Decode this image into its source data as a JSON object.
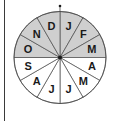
{
  "diagram": {
    "type": "month-wheel",
    "start_at_top": true,
    "direction": "clockwise",
    "months": [
      {
        "label": "J",
        "shaded": true
      },
      {
        "label": "F",
        "shaded": true
      },
      {
        "label": "M",
        "shaded": true
      },
      {
        "label": "A",
        "shaded": false
      },
      {
        "label": "M",
        "shaded": false
      },
      {
        "label": "J",
        "shaded": false
      },
      {
        "label": "J",
        "shaded": false
      },
      {
        "label": "A",
        "shaded": false
      },
      {
        "label": "S",
        "shaded": false
      },
      {
        "label": "O",
        "shaded": true
      },
      {
        "label": "N",
        "shaded": true
      },
      {
        "label": "D",
        "shaded": true
      }
    ],
    "colors": {
      "shaded": "#cfcfcf",
      "unshaded": "#ffffff",
      "stroke": "#4a4a4a"
    }
  }
}
